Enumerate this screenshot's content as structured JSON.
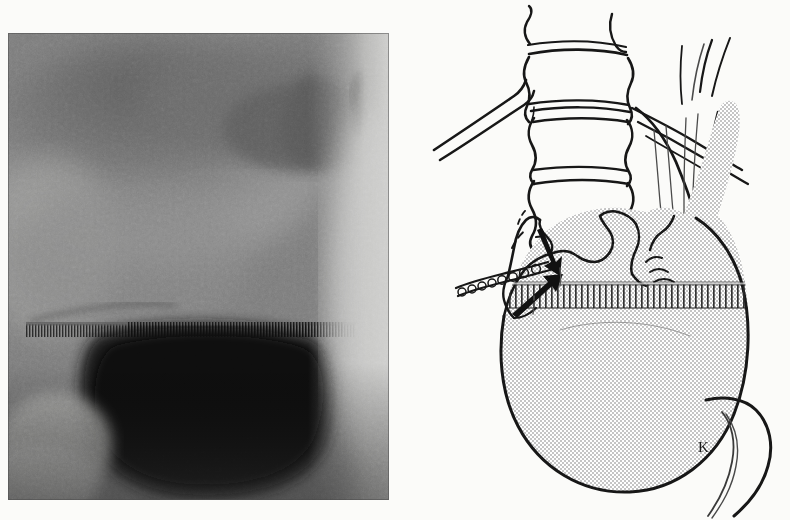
{
  "figure": {
    "kind": "medical-figure",
    "caption": "",
    "background_color": "#fbfbf9",
    "panels": [
      "radiograph",
      "line-diagram"
    ]
  },
  "radiograph": {
    "label": "",
    "modality": "barium-contrast radiograph",
    "region": "upper gastrointestinal tract",
    "frame": {
      "x": 8,
      "y": 33,
      "width": 381,
      "height": 467
    },
    "tones": {
      "film_base": "#6e6e6e",
      "soft_tissue_mid": "#8a8a8a",
      "soft_tissue_light": "#b9b9b7",
      "barium_dense": "#121212",
      "barium_dark": "#1e1e1e",
      "edge_dark": "#0a0a0a"
    },
    "features": [
      {
        "name": "gas-filled-fundus-shadow",
        "description": "broad mid-grey density across upper film"
      },
      {
        "name": "dense-barium-pool",
        "description": "very dark barium collection in lower stomach"
      },
      {
        "name": "air-barium-level",
        "description": "horizontal banded interface at mid film"
      },
      {
        "name": "dark-marginal-streak",
        "description": "dark vertical streak near upper right film edge"
      },
      {
        "name": "diagonal-linear-density",
        "description": "faint oblique line at mid-left of film"
      },
      {
        "name": "lucent-right-margin",
        "description": "pale band down the right side of the film"
      }
    ]
  },
  "diagram": {
    "label": "",
    "signature": "K.",
    "ink_color": "#171717",
    "stipple_color": "#7d7d7d",
    "structures": [
      {
        "name": "vertebral-column",
        "label": "",
        "count": 4,
        "description": "four lumbar vertebral bodies with concave lateral margins and intervertebral disc spaces"
      },
      {
        "name": "rib-pair-left",
        "label": "",
        "count": 2,
        "description": "two oblique parallel rib outlines descending to the left"
      },
      {
        "name": "rib-pair-right",
        "label": "",
        "count": 2,
        "description": "two oblique rib outlines crossing to the right"
      },
      {
        "name": "esophagus",
        "label": "",
        "description": "tubular esophagus with longitudinal mucosal folds entering the gastric fundus"
      },
      {
        "name": "stomach-body",
        "label": "",
        "description": "large stippled gastric shadow occupying the lower field"
      },
      {
        "name": "rugal-fold-band",
        "label": "",
        "description": "vertically hatched band of rugal folds across the upper stomach"
      },
      {
        "name": "lesser-curvature-niche",
        "label": "",
        "description": "irregular notched contour along the lesser curvature"
      },
      {
        "name": "beaded-ribbon",
        "label": "",
        "description": "chain-like beaded streak extending to the left from the lesser curve"
      },
      {
        "name": "duodenal-outline",
        "label": "",
        "description": "curved duodenal loop descending at lower right"
      }
    ],
    "annotations": [
      {
        "name": "arrow-upper",
        "type": "arrow",
        "label": "",
        "points_to": "lesser-curvature-defect",
        "direction": "down-right"
      },
      {
        "name": "arrow-lower",
        "type": "arrow",
        "label": "",
        "points_to": "gastric-notch",
        "direction": "up-right"
      }
    ]
  }
}
